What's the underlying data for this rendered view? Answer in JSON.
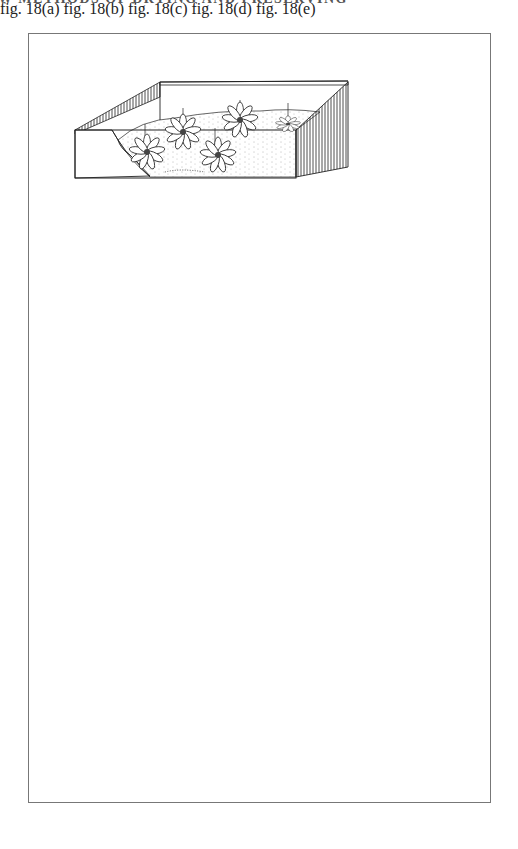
{
  "page": {
    "running_head": "W  METHODS OF DRYING AND PRESERVING"
  },
  "figures": [
    {
      "id": "a",
      "caption": "fig. 18(a)",
      "subject": "daisy-type flowers face-up in drying medium, wires upright"
    },
    {
      "id": "b",
      "caption": "fig. 18(b)",
      "subject": "rose upright in drying medium, stem curved"
    },
    {
      "id": "c",
      "caption": "fig. 18(c)",
      "subject": "flat flower face-up in drying medium"
    },
    {
      "id": "d",
      "caption": "fig. 18(d)",
      "subject": "bell-shaped flower laid on its side in drying medium"
    },
    {
      "id": "e",
      "caption": "fig. 18(e)",
      "subject": "layered flowers and spray in drying medium"
    }
  ]
}
